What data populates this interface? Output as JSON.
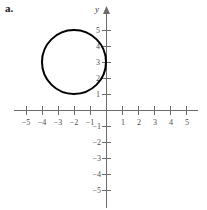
{
  "figure": {
    "part_label": "a.",
    "axis_labels": {
      "y": "y"
    },
    "geometry": {
      "origin_px": [
        106,
        110
      ],
      "unit_px": 16,
      "x_axis_y_px": 110,
      "y_axis_x_px": 106
    }
  },
  "chart_data": {
    "type": "scatter",
    "title": "",
    "xlabel": "",
    "ylabel": "y",
    "xlim": [
      -5.75,
      5.75
    ],
    "ylim": [
      -6.2,
      6.2
    ],
    "grid": false,
    "legend": null,
    "x_ticks": [
      -5,
      -4,
      -3,
      -2,
      -1,
      1,
      2,
      3,
      4,
      5
    ],
    "x_tick_labels": [
      "−5",
      "−4",
      "−3",
      "−2",
      "−1",
      "1",
      "2",
      "3",
      "4",
      "5"
    ],
    "y_ticks": [
      5,
      4,
      3,
      2,
      1,
      -1,
      -2,
      -3,
      -4,
      -5
    ],
    "y_tick_labels": [
      "5",
      "4",
      "3",
      "2",
      "1",
      "−1",
      "−2",
      "−3",
      "−4",
      "−5"
    ],
    "shapes": [
      {
        "kind": "circle",
        "center": [
          -2,
          3
        ],
        "radius": 2,
        "stroke": "#000000",
        "fill": "none",
        "equation": "(x + 2)^2 + (y - 3)^2 = 4"
      }
    ]
  }
}
